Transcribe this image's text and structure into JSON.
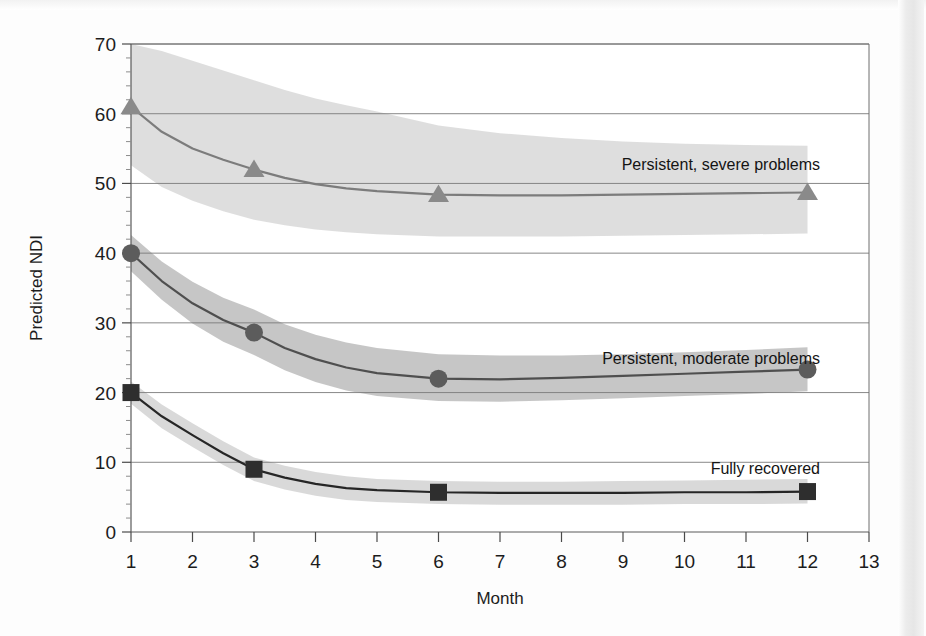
{
  "figure": {
    "background_color": "#fdfdfd",
    "plot_frame_color": "#6e6e6e"
  },
  "axes": {
    "y_title": "Predicted NDI",
    "x_title": "Month",
    "y_ticks": [
      "0",
      "10",
      "20",
      "30",
      "40",
      "50",
      "60",
      "70"
    ],
    "x_ticks": [
      "1",
      "2",
      "3",
      "4",
      "5",
      "6",
      "7",
      "8",
      "9",
      "10",
      "11",
      "12",
      "13"
    ]
  },
  "annotations": {
    "severe_label": "Persistent, severe problems",
    "moderate_label": "Persistent, moderate problems",
    "recovered_label": "Fully recovered"
  },
  "chart_data": {
    "type": "line",
    "title": "",
    "xlabel": "Month",
    "ylabel": "Predicted NDI",
    "xlim": [
      1,
      13
    ],
    "ylim": [
      0,
      70
    ],
    "x_ticks": [
      1,
      2,
      3,
      4,
      5,
      6,
      7,
      8,
      9,
      10,
      11,
      12,
      13
    ],
    "y_ticks": [
      0,
      10,
      20,
      30,
      40,
      50,
      60,
      70
    ],
    "y_minor_tick_step": 2,
    "grid": "horizontal",
    "legend_position": "inline-right",
    "marker_x": [
      1,
      3,
      6,
      12
    ],
    "series": [
      {
        "name": "Persistent, severe problems",
        "marker": "triangle",
        "line_color": "#7c7c7c",
        "marker_color": "#8a8a8a",
        "band_color": "#d8d8d8",
        "values": [
          61.0,
          52.0,
          48.4,
          48.7
        ],
        "curve_x": [
          1,
          1.5,
          2,
          2.5,
          3,
          3.5,
          4,
          4.5,
          5,
          6,
          7,
          8,
          9,
          10,
          11,
          12
        ],
        "curve_y": [
          61.0,
          57.4,
          55.0,
          53.4,
          52.0,
          50.8,
          49.9,
          49.3,
          48.9,
          48.4,
          48.3,
          48.3,
          48.4,
          48.5,
          48.6,
          48.7
        ],
        "band_upper": [
          70.2,
          69.0,
          67.6,
          66.2,
          64.8,
          63.4,
          62.2,
          61.2,
          60.3,
          58.3,
          57.2,
          56.5,
          56.0,
          55.7,
          55.5,
          55.4
        ],
        "band_lower": [
          52.6,
          49.5,
          47.5,
          46.0,
          44.8,
          44.0,
          43.4,
          43.0,
          42.7,
          42.4,
          42.4,
          42.4,
          42.5,
          42.6,
          42.7,
          42.8
        ]
      },
      {
        "name": "Persistent, moderate problems",
        "marker": "circle",
        "line_color": "#4f4f4f",
        "marker_color": "#5c5c5c",
        "band_color": "#bcbcbc",
        "values": [
          40.0,
          28.6,
          22.0,
          23.3
        ],
        "curve_x": [
          1,
          1.5,
          2,
          2.5,
          3,
          3.5,
          4,
          4.5,
          5,
          6,
          7,
          8,
          9,
          10,
          11,
          12
        ],
        "curve_y": [
          40.0,
          36.0,
          32.8,
          30.4,
          28.6,
          26.4,
          24.8,
          23.6,
          22.8,
          22.0,
          21.9,
          22.1,
          22.4,
          22.7,
          23.0,
          23.3
        ],
        "band_upper": [
          42.6,
          38.8,
          35.9,
          33.6,
          31.9,
          29.8,
          28.3,
          27.2,
          26.4,
          25.5,
          25.3,
          25.3,
          25.5,
          25.8,
          26.1,
          26.5
        ],
        "band_lower": [
          37.4,
          33.3,
          29.9,
          27.3,
          25.4,
          23.2,
          21.5,
          20.3,
          19.5,
          18.8,
          18.7,
          18.9,
          19.2,
          19.5,
          19.8,
          20.2
        ]
      },
      {
        "name": "Fully recovered",
        "marker": "square",
        "line_color": "#262626",
        "marker_color": "#2e2e2e",
        "band_color": "#d2d2d2",
        "values": [
          20.0,
          9.0,
          5.7,
          5.8
        ],
        "curve_x": [
          1,
          1.5,
          2,
          2.5,
          3,
          3.5,
          4,
          4.5,
          5,
          6,
          7,
          8,
          9,
          10,
          11,
          12
        ],
        "curve_y": [
          20.0,
          16.6,
          13.9,
          11.3,
          9.0,
          7.8,
          6.9,
          6.3,
          6.0,
          5.7,
          5.6,
          5.6,
          5.6,
          5.7,
          5.7,
          5.8
        ],
        "band_upper": [
          21.6,
          18.3,
          15.6,
          13.0,
          10.7,
          9.5,
          8.6,
          8.0,
          7.6,
          7.3,
          7.2,
          7.2,
          7.3,
          7.4,
          7.5,
          7.6
        ],
        "band_lower": [
          18.4,
          14.9,
          12.2,
          9.6,
          7.3,
          6.1,
          5.2,
          4.6,
          4.3,
          4.0,
          3.9,
          3.9,
          3.9,
          4.0,
          4.0,
          4.1
        ]
      }
    ]
  }
}
